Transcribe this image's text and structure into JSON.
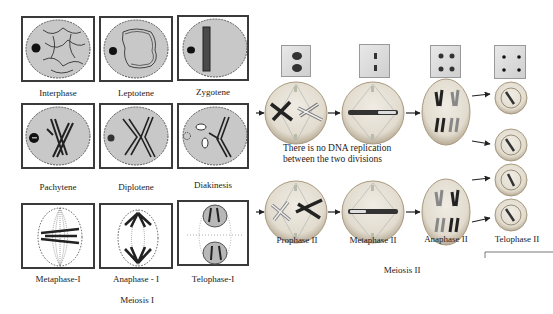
{
  "meiosis_1": {
    "title": "Meiosis I",
    "stages": [
      {
        "label": "Interphase"
      },
      {
        "label": "Leptotene"
      },
      {
        "label": "Zygotene"
      },
      {
        "label": "Pachytene"
      },
      {
        "label": "Diplotene"
      },
      {
        "label": "Diakinesis"
      },
      {
        "label": "Metaphase-I"
      },
      {
        "label": "Anaphase - I"
      },
      {
        "label": "Telophase-I"
      }
    ]
  },
  "meiosis_2": {
    "title": "Meiosis II",
    "note_line1": "There is no DNA replication",
    "note_line2": "between the two divisions",
    "stages": [
      {
        "label": "Prophase II"
      },
      {
        "label": "Metaphase II"
      },
      {
        "label": "Anaphase II"
      },
      {
        "label": "Telophase II"
      }
    ]
  },
  "colors": {
    "cell_fill": "#c8c8c8",
    "box_border": "#3a3a3a",
    "chromosome": "#2a2a2a"
  }
}
